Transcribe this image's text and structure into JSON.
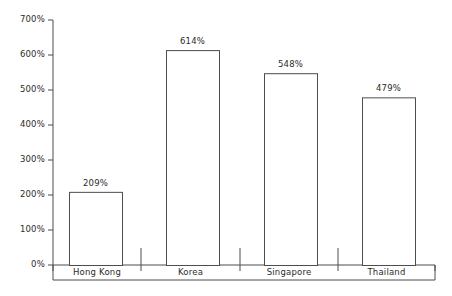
{
  "chart_data": {
    "type": "bar",
    "title": "",
    "subtitle": "",
    "xlabel": "",
    "ylabel": "",
    "categories": [
      "Hong Kong",
      "Korea",
      "Singapore",
      "Thailand"
    ],
    "values": [
      209,
      614,
      548,
      479
    ],
    "value_labels": [
      "209%",
      "614%",
      "548%",
      "479%"
    ],
    "ylim": [
      0,
      700
    ],
    "ytick_values": [
      0,
      100,
      200,
      300,
      400,
      500,
      600,
      700
    ],
    "ytick_labels": [
      "0%",
      "100%",
      "200%",
      "300%",
      "400%",
      "500%",
      "600%",
      "700%"
    ],
    "grid": false,
    "legend": null,
    "bar_fill_color": "#ffffff",
    "bar_stroke_color": "#4d4d4d",
    "axis_color": "#4d4d4d",
    "text_color": "#2b2b2b",
    "background_color": "#ffffff"
  }
}
